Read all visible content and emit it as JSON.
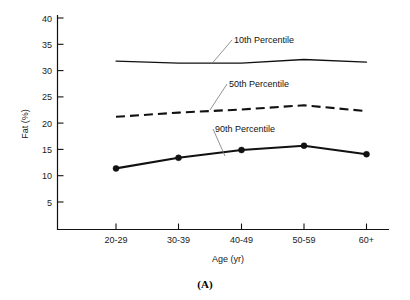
{
  "chart_data": {
    "type": "line",
    "title": "",
    "panel_label": "(A)",
    "xlabel": "Age (yr)",
    "ylabel": "Fat (%)",
    "categories": [
      "20-29",
      "30-39",
      "40-49",
      "50-59",
      "60+"
    ],
    "ylim": [
      0,
      40
    ],
    "yticks": [
      5,
      10,
      15,
      20,
      25,
      30,
      35,
      40
    ],
    "ytick_labels": [
      "5",
      "10",
      "15",
      "20",
      "25",
      "30",
      "35",
      "40"
    ],
    "grid": false,
    "legend_position": "inline-annotations",
    "series": [
      {
        "name": "10th Percentile",
        "style": "solid-thin",
        "markers": false,
        "values": [
          31.8,
          31.4,
          31.4,
          32.1,
          31.6
        ]
      },
      {
        "name": "50th Percentile",
        "style": "dashed",
        "markers": false,
        "values": [
          21.2,
          22.0,
          22.6,
          23.4,
          22.3
        ]
      },
      {
        "name": "90th Percentile",
        "style": "solid-thick",
        "markers": true,
        "values": [
          11.4,
          13.4,
          14.9,
          15.7,
          14.1
        ]
      }
    ],
    "annotations": [
      {
        "text": "10th Percentile",
        "series": "10th Percentile"
      },
      {
        "text": "50th Percentile",
        "series": "50th Percentile"
      },
      {
        "text": "90th Percentile",
        "series": "90th Percentile"
      }
    ]
  },
  "axes": {
    "y_tick_0": "5",
    "y_tick_1": "10",
    "y_tick_2": "15",
    "y_tick_3": "20",
    "y_tick_4": "25",
    "y_tick_5": "30",
    "y_tick_6": "35",
    "y_tick_7": "40",
    "x_tick_0": "20-29",
    "x_tick_1": "30-39",
    "x_tick_2": "40-49",
    "x_tick_3": "50-59",
    "x_tick_4": "60+"
  },
  "labels": {
    "y_axis_title": "Fat (%)",
    "x_axis_title": "Age (yr)",
    "panel": "(A)",
    "series_10th": "10th Percentile",
    "series_50th": "50th Percentile",
    "series_90th": "90th Percentile"
  }
}
